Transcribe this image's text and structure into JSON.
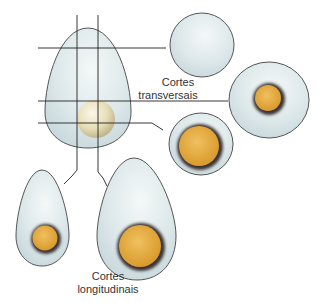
{
  "labels": {
    "transverse_line1": "Cortes",
    "transverse_line2": "transversais",
    "longitudinal_line1": "Cortes",
    "longitudinal_line2": "longitudinais"
  },
  "colors": {
    "egg_fill": "#d6e4e8",
    "egg_stroke": "#555555",
    "yolk": "#e0a93a",
    "yolk_rim": "#3a3030",
    "whole_yolk": "#e8e0c0",
    "line": "#222222"
  }
}
